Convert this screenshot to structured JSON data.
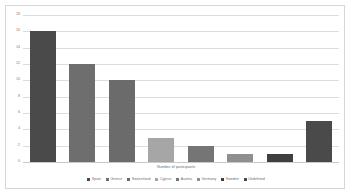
{
  "chart_data": {
    "type": "bar",
    "title": "",
    "xlabel": "Number of participants",
    "ylabel": "",
    "categories": [
      "Spain",
      "Greece",
      "Switzerland",
      "Cyprus",
      "Austria",
      "Germany",
      "Sweden",
      "Undefined"
    ],
    "values": [
      16,
      12,
      10,
      3,
      2,
      1,
      1,
      5
    ],
    "colors": [
      "#4a4a4a",
      "#6e6e6e",
      "#6b6b6b",
      "#a6a6a6",
      "#757575",
      "#8f8f8f",
      "#3f3f3f",
      "#4a4a4a"
    ],
    "ylim": [
      0,
      18
    ],
    "yticks": [
      0,
      2,
      4,
      6,
      8,
      10,
      12,
      14,
      16,
      18
    ],
    "ytick_labels": [
      "0",
      "2",
      "4",
      "6",
      "8",
      "10",
      "12",
      "14",
      "16",
      "18"
    ],
    "grid": true,
    "legend_position": "bottom"
  },
  "frame": {
    "border_color": "#d6d6d6",
    "background": "#ffffff"
  }
}
